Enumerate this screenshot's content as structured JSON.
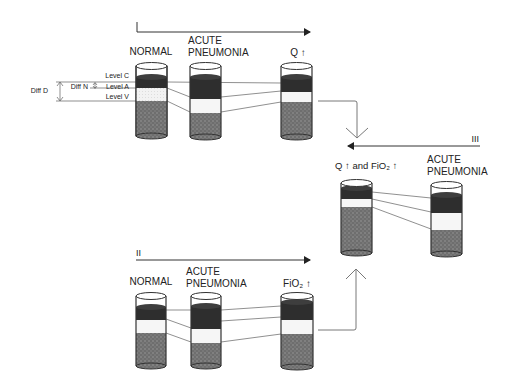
{
  "colors": {
    "stroke": "#333333",
    "dark_band": "#2e2e2e",
    "light_band": "#f4f4f4",
    "stipple_base": "#6e6e6e",
    "stipple_dot": "#9a9a9a"
  },
  "panel_I": {
    "roman": "",
    "cylinders": [
      {
        "label_lines": [
          "NORMAL"
        ],
        "x": 136,
        "top": 63,
        "bottom": 136,
        "dark": [
          77,
          88
        ],
        "light": [
          88,
          101
        ],
        "stipple": [
          101,
          136
        ]
      },
      {
        "label_lines": [
          "ACUTE",
          "PNEUMONIA"
        ],
        "x": 190,
        "top": 63,
        "bottom": 137,
        "dark": [
          77,
          99
        ],
        "light": [
          99,
          113
        ],
        "stipple": [
          113,
          137
        ]
      },
      {
        "label_lines": [
          "Q ↑"
        ],
        "x": 281,
        "top": 63,
        "bottom": 137,
        "dark": [
          77,
          92
        ],
        "light": [
          92,
          102
        ],
        "stipple": [
          102,
          137
        ]
      }
    ]
  },
  "level_labels": {
    "level_c": "Level C",
    "level_a": "Level A",
    "level_v": "Level V",
    "diff_n": "Diff N",
    "diff_d": "Diff D"
  },
  "panel_II": {
    "roman": "II",
    "cylinders": [
      {
        "label_lines": [
          "NORMAL"
        ],
        "x": 136,
        "top": 293,
        "bottom": 366,
        "dark": [
          307,
          320
        ],
        "light": [
          320,
          333
        ],
        "stipple": [
          333,
          366
        ]
      },
      {
        "label_lines": [
          "ACUTE",
          "PNEUMONIA"
        ],
        "x": 191,
        "top": 293,
        "bottom": 366,
        "dark": [
          306,
          329
        ],
        "light": [
          329,
          343
        ],
        "stipple": [
          343,
          366
        ]
      },
      {
        "label_lines": [
          "FiO₂ ↑"
        ],
        "x": 281,
        "top": 293,
        "bottom": 367,
        "dark": [
          302,
          320
        ],
        "light": [
          320,
          334
        ],
        "stipple": [
          334,
          367
        ]
      }
    ]
  },
  "panel_III": {
    "roman": "III",
    "cylinders": [
      {
        "label_lines": [
          "ACUTE",
          "PNEUMONIA"
        ],
        "x": 431,
        "top": 182,
        "bottom": 254,
        "dark": [
          195,
          213
        ],
        "light": [
          213,
          230
        ],
        "stipple": [
          230,
          254
        ]
      },
      {
        "label_lines": [
          "Q ↑ and FiO₂ ↑"
        ],
        "x": 341,
        "top": 180,
        "bottom": 253,
        "dark": [
          188,
          199
        ],
        "light": [
          199,
          207
        ],
        "stipple": [
          207,
          253
        ]
      }
    ]
  },
  "labels": {
    "normal": "NORMAL",
    "acute": "ACUTE",
    "pneumonia": "PNEUMONIA",
    "q_up": "Q ↑",
    "fio2_up": "FiO₂ ↑",
    "q_and_fio2_up": "Q ↑ and FiO₂ ↑",
    "roman_II": "II",
    "roman_III": "III"
  }
}
